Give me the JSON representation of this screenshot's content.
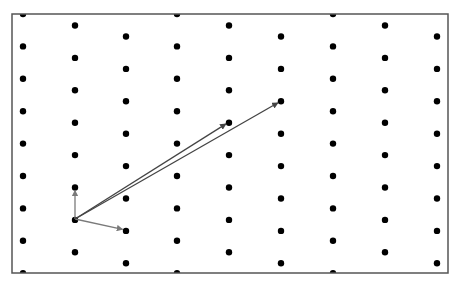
{
  "diagram": {
    "type": "lattice",
    "frame": {
      "x": 12,
      "y": 14,
      "width": 436,
      "height": 259,
      "stroke": "#555555"
    },
    "dot_color": "#000000",
    "dot_radius": 3.2,
    "columns_x": [
      23,
      75,
      126,
      177,
      229,
      281,
      333,
      385,
      437
    ],
    "column_y_offsets": [
      14,
      25.5,
      36.5
    ],
    "row_spacing": 32.4,
    "origin": {
      "x": 75,
      "y": 219
    },
    "vectors": [
      {
        "name": "basis-vector-up",
        "to": {
          "x": 75,
          "y": 187
        },
        "color": "#7a7a7a",
        "width": 1.3
      },
      {
        "name": "basis-vector-right",
        "to": {
          "x": 126,
          "y": 230
        },
        "color": "#7a7a7a",
        "width": 1.3
      },
      {
        "name": "long-vector-1",
        "to": {
          "x": 229,
          "y": 122
        },
        "color": "#444444",
        "width": 1.3
      },
      {
        "name": "long-vector-2",
        "to": {
          "x": 281,
          "y": 101
        },
        "color": "#444444",
        "width": 1.3
      }
    ]
  }
}
